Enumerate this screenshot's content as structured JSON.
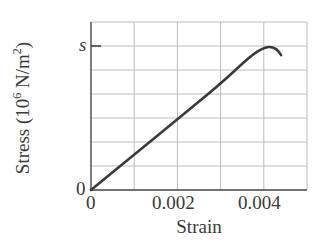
{
  "chart_data": {
    "type": "line",
    "title": "",
    "xlabel": "Strain",
    "ylabel": "Stress (10^6 N/m^2)",
    "ylabel_parts": {
      "pre": "Stress (10",
      "exp1": "6",
      "mid": " N/m",
      "exp2": "2",
      "post": ")"
    },
    "xlim": [
      0,
      0.005
    ],
    "ylim_grid_units": [
      0,
      7
    ],
    "x_ticks": [
      {
        "value": 0,
        "label": "0"
      },
      {
        "value": 0.002,
        "label": "0.002"
      },
      {
        "value": 0.004,
        "label": "0.004"
      }
    ],
    "y_ticks": [
      {
        "value": 0,
        "label": "0"
      },
      {
        "value": "s",
        "label": "s"
      }
    ],
    "grid": true,
    "grid_x_step": 0.001,
    "grid_y_divisions": 7,
    "s_level_grid_units": 6,
    "series": [
      {
        "name": "stress-strain curve",
        "color": "#3a3a3a",
        "points": [
          [
            0,
            0
          ],
          [
            0.001,
            1.47
          ],
          [
            0.002,
            2.95
          ],
          [
            0.003,
            4.42
          ],
          [
            0.0037,
            5.6
          ],
          [
            0.004,
            5.93
          ],
          [
            0.00415,
            5.97
          ],
          [
            0.0043,
            5.88
          ],
          [
            0.0044,
            5.62
          ]
        ]
      }
    ]
  },
  "labels": {
    "x_tick_0": "0",
    "x_tick_002": "0.002",
    "x_tick_004": "0.004",
    "y_tick_0": "0",
    "y_tick_s": "s",
    "xlabel": "Strain"
  }
}
